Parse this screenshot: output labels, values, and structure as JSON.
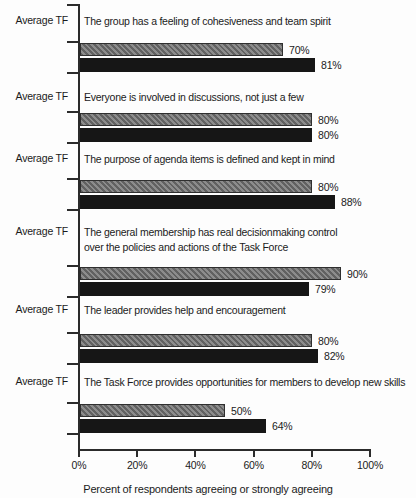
{
  "chart_data": {
    "type": "bar",
    "orientation": "horizontal",
    "row_label": "Average TF",
    "xlabel": "Percent of respondents agreeing or strongly agreeing",
    "xlim": [
      0,
      100
    ],
    "x_ticks": [
      "0%",
      "20%",
      "40%",
      "60%",
      "80%",
      "100%"
    ],
    "grid": false,
    "legend": false,
    "series_names": [
      "gray",
      "black"
    ],
    "colors": {
      "gray_bar": "#7c7c7c",
      "black_bar": "#161616",
      "axis": "#2b2b2b",
      "text": "#1b1b1b",
      "background": "#fdfdfd"
    },
    "groups": [
      {
        "statement_lines": [
          "The group has a feeling of cohesiveness and team spirit"
        ],
        "bars": [
          {
            "series": "gray",
            "value": 70,
            "label": "70%"
          },
          {
            "series": "black",
            "value": 81,
            "label": "81%"
          }
        ]
      },
      {
        "statement_lines": [
          "Everyone is involved in discussions, not just a few"
        ],
        "bars": [
          {
            "series": "gray",
            "value": 80,
            "label": "80%"
          },
          {
            "series": "black",
            "value": 80,
            "label": "80%"
          }
        ]
      },
      {
        "statement_lines": [
          "The purpose of agenda items is defined and kept in mind"
        ],
        "bars": [
          {
            "series": "gray",
            "value": 80,
            "label": "80%"
          },
          {
            "series": "black",
            "value": 88,
            "label": "88%"
          }
        ]
      },
      {
        "statement_lines": [
          "The general membership has real decisionmaking control",
          "over the policies and actions of the Task Force"
        ],
        "bars": [
          {
            "series": "gray",
            "value": 90,
            "label": "90%"
          },
          {
            "series": "black",
            "value": 79,
            "label": "79%"
          }
        ]
      },
      {
        "statement_lines": [
          "The leader provides help and encouragement"
        ],
        "bars": [
          {
            "series": "gray",
            "value": 80,
            "label": "80%"
          },
          {
            "series": "black",
            "value": 82,
            "label": "82%"
          }
        ]
      },
      {
        "statement_lines": [
          "The Task Force provides opportunities for members to develop new skills"
        ],
        "bars": [
          {
            "series": "gray",
            "value": 50,
            "label": "50%"
          },
          {
            "series": "black",
            "value": 64,
            "label": "64%"
          }
        ]
      }
    ]
  }
}
